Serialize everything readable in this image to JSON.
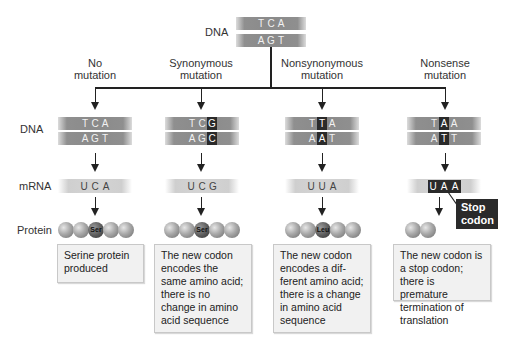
{
  "top": {
    "label": "DNA",
    "top_strand": [
      "T",
      "C",
      "A"
    ],
    "bottom_strand": [
      "A",
      "G",
      "T"
    ]
  },
  "row_labels": {
    "dna": "DNA",
    "mrna": "mRNA",
    "protein": "Protein"
  },
  "columns": [
    {
      "title_line1": "No",
      "title_line2": "mutation",
      "dna_top": [
        "T",
        "C",
        "A"
      ],
      "dna_bottom": [
        "A",
        "G",
        "T"
      ],
      "highlight_index": -1,
      "mrna": [
        "U",
        "C",
        "A"
      ],
      "amino_label": "Ser",
      "description": "Serine protein produced"
    },
    {
      "title_line1": "Synonymous",
      "title_line2": "mutation",
      "dna_top": [
        "T",
        "C",
        "G"
      ],
      "dna_bottom": [
        "A",
        "G",
        "C"
      ],
      "highlight_index": 2,
      "mrna": [
        "U",
        "C",
        "G"
      ],
      "amino_label": "Ser",
      "description": "The new codon encodes the same amino acid; there is no change in amino acid sequence"
    },
    {
      "title_line1": "Nonsynonymous",
      "title_line2": "mutation",
      "dna_top": [
        "T",
        "T",
        "A"
      ],
      "dna_bottom": [
        "A",
        "A",
        "T"
      ],
      "highlight_index": 1,
      "mrna": [
        "U",
        "U",
        "A"
      ],
      "amino_label": "Leu",
      "description": "The new codon encodes a dif-ferent amino acid; there is a change in amino acid sequence"
    },
    {
      "title_line1": "Nonsense",
      "title_line2": "mutation",
      "dna_top": [
        "T",
        "A",
        "A"
      ],
      "dna_bottom": [
        "A",
        "T",
        "T"
      ],
      "highlight_index": 1,
      "mrna": [
        "U",
        "A",
        "A"
      ],
      "amino_label": "",
      "description": "The new codon is a stop codon; there is premature termination of translation",
      "callout": "Stop codon"
    }
  ],
  "colors": {
    "dna_strand": "#8a8a8a",
    "highlight": "#2a2a2a",
    "mrna": "#d4d4d4",
    "description_bg": "#f1f1f1"
  }
}
